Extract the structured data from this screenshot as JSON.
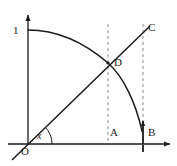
{
  "figure": {
    "kind": "geometry-diagram",
    "background_color": "#ffffff",
    "stroke_color": "#1a1a1a",
    "dash_color": "#8a8a8a",
    "width": 177,
    "height": 166,
    "labels": {
      "y_axis_unit": "1",
      "line_end": "C",
      "intersection": "D",
      "foot_of_d": "A",
      "point_b": "B",
      "origin": "O",
      "angle": "x"
    },
    "axes": {
      "origin_px": [
        28,
        144
      ],
      "x_axis_end_px": [
        172,
        144
      ],
      "y_axis_top_px": [
        28,
        13
      ],
      "x_tick_px": [
        143,
        144
      ]
    },
    "elements": [
      {
        "name": "y-axis",
        "type": "arrow",
        "from": [
          28,
          144
        ],
        "to": [
          28,
          13
        ]
      },
      {
        "name": "x-axis",
        "type": "arrow",
        "from": [
          8,
          144
        ],
        "to": [
          172,
          144
        ]
      },
      {
        "name": "cosine-curve",
        "type": "curve",
        "from": [
          28,
          30
        ],
        "to": [
          143,
          134
        ]
      },
      {
        "name": "diagonal-line",
        "type": "line",
        "from": [
          12,
          160
        ],
        "to": [
          152,
          25
        ]
      },
      {
        "name": "dashed-vertical-A",
        "type": "dashed-line",
        "from": [
          108,
          24
        ],
        "to": [
          108,
          144
        ]
      },
      {
        "name": "dashed-vertical-B",
        "type": "dashed-line",
        "from": [
          143,
          24
        ],
        "to": [
          143,
          144
        ]
      },
      {
        "name": "angle-arc",
        "type": "arc",
        "center": [
          28,
          144
        ],
        "radius": 24
      },
      {
        "name": "segment-b-arrow",
        "type": "arrow",
        "from": [
          143,
          144
        ],
        "to": [
          143,
          118
        ]
      }
    ]
  }
}
